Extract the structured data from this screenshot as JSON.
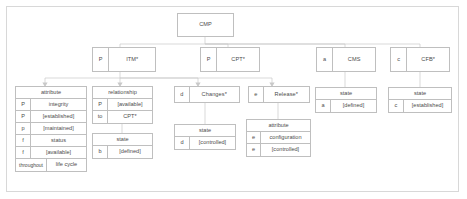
{
  "diagram": {
    "type": "tree",
    "root": {
      "key": "",
      "label": "CMP"
    },
    "level2": [
      {
        "key": "P",
        "label": "ITM*"
      },
      {
        "key": "P",
        "label": "CPT*"
      },
      {
        "key": "a",
        "label": "CMS"
      },
      {
        "key": "c",
        "label": "CFB*"
      }
    ],
    "level3": [
      {
        "key": "d",
        "label": "Changes*"
      },
      {
        "key": "e",
        "label": "Release*"
      }
    ],
    "tables": {
      "itm_attribute": {
        "header": "attribute",
        "rows": [
          {
            "key": "P",
            "value": "integrity"
          },
          {
            "key": "P",
            "value": "[established]"
          },
          {
            "key": "p",
            "value": "[maintained]"
          },
          {
            "key": "f",
            "value": "status"
          },
          {
            "key": "f",
            "value": "[available]"
          },
          {
            "key": "throughout",
            "value": "life cycle"
          }
        ]
      },
      "itm_relationship": {
        "header": "relationship",
        "rows": [
          {
            "key": "P",
            "value": "[available]"
          },
          {
            "key": "to",
            "value": "CPT*"
          }
        ]
      },
      "itm_state": {
        "header": "state",
        "rows": [
          {
            "key": "b",
            "value": "[defined]"
          }
        ]
      },
      "changes_state": {
        "header": "state",
        "rows": [
          {
            "key": "d",
            "value": "[controlled]"
          }
        ]
      },
      "release_attribute": {
        "header": "attribute",
        "rows": [
          {
            "key": "e",
            "value": "configuration"
          },
          {
            "key": "e",
            "value": "[controlled]"
          }
        ]
      },
      "cms_state": {
        "header": "state",
        "rows": [
          {
            "key": "a",
            "value": "[defined]"
          }
        ]
      },
      "cfb_state": {
        "header": "state",
        "rows": [
          {
            "key": "c",
            "value": "[established]"
          }
        ]
      }
    },
    "colors": {
      "border": "#bfbfbf",
      "frame": "#d8d8d8",
      "text": "#4c4c4c",
      "wire": "#c9c9c9",
      "background": "#ffffff"
    }
  }
}
